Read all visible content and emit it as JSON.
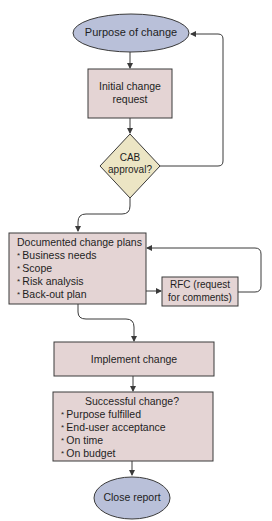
{
  "colors": {
    "terminal_fill": "#b9c0d9",
    "process_fill": "#e4d4d4",
    "decision_fill": "#ece5c4",
    "stroke": "#3a3a3a",
    "background": "#ffffff"
  },
  "nodes": {
    "start": {
      "type": "terminal",
      "label": "Purpose of change"
    },
    "initial_request": {
      "type": "process",
      "label_line1": "Initial change",
      "label_line2": "request"
    },
    "cab_approval": {
      "type": "decision",
      "label_line1": "CAB",
      "label_line2": "approval?"
    },
    "documented_plans": {
      "type": "process",
      "title": "Documented change plans",
      "items": [
        "Business needs",
        "Scope",
        "Risk analysis",
        "Back-out plan"
      ]
    },
    "rfc": {
      "type": "process",
      "label_line1": "RFC (request",
      "label_line2": "for comments)"
    },
    "implement": {
      "type": "process",
      "label": "Implement change"
    },
    "successful": {
      "type": "process",
      "title": "Successful change?",
      "items": [
        "Purpose fulfilled",
        "End-user acceptance",
        "On time",
        "On budget"
      ]
    },
    "end": {
      "type": "terminal",
      "label": "Close report"
    }
  },
  "edges": [
    {
      "from": "start",
      "to": "initial_request"
    },
    {
      "from": "initial_request",
      "to": "cab_approval"
    },
    {
      "from": "cab_approval",
      "to": "start",
      "kind": "loop-back"
    },
    {
      "from": "cab_approval",
      "to": "documented_plans"
    },
    {
      "from": "documented_plans",
      "to": "rfc"
    },
    {
      "from": "rfc",
      "to": "documented_plans",
      "kind": "loop-back"
    },
    {
      "from": "documented_plans",
      "to": "implement"
    },
    {
      "from": "implement",
      "to": "successful"
    },
    {
      "from": "successful",
      "to": "end"
    }
  ]
}
